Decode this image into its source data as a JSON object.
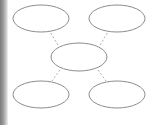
{
  "diagram": {
    "type": "cluster-map",
    "colors": {
      "stroke": "#8c8c8c",
      "connector": "#b0b0b0",
      "background": "#ffffff"
    },
    "nodes": [
      {
        "id": "top-left",
        "label": "",
        "cx": 41,
        "cy": 18.5,
        "rx": 28,
        "ry": 13.5
      },
      {
        "id": "top-right",
        "label": "",
        "cx": 117,
        "cy": 18.5,
        "rx": 28,
        "ry": 13.5
      },
      {
        "id": "center",
        "label": "",
        "cx": 79,
        "cy": 57,
        "rx": 28,
        "ry": 14
      },
      {
        "id": "bottom-left",
        "label": "",
        "cx": 41,
        "cy": 94.5,
        "rx": 28,
        "ry": 13.5
      },
      {
        "id": "bottom-right",
        "label": "",
        "cx": 117,
        "cy": 94.5,
        "rx": 28,
        "ry": 13.5
      }
    ],
    "edges": [
      {
        "from": "center",
        "to": "top-left",
        "style": "dashed"
      },
      {
        "from": "center",
        "to": "top-right",
        "style": "dashed"
      },
      {
        "from": "center",
        "to": "bottom-left",
        "style": "dashed"
      },
      {
        "from": "center",
        "to": "bottom-right",
        "style": "dashed"
      }
    ]
  }
}
